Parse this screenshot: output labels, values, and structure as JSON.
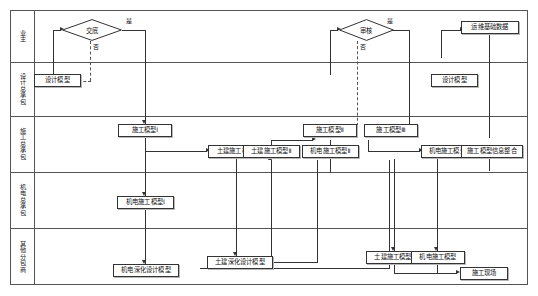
{
  "diagram": {
    "type": "swimlane-flowchart",
    "colors": {
      "line": "#333333",
      "frame": "#555555",
      "node_fill": "#ffffff",
      "text": "#111111"
    },
    "lanes": [
      {
        "id": "owner",
        "label": "业主"
      },
      {
        "id": "design",
        "label": "设计总承包"
      },
      {
        "id": "gc",
        "label": "施工总承包"
      },
      {
        "id": "mep_gc",
        "label": "机电总承包"
      },
      {
        "id": "sub",
        "label": "其他分包商"
      }
    ],
    "nodes": [
      {
        "id": "d1",
        "lane": "owner",
        "shape": "diamond",
        "label": "交底"
      },
      {
        "id": "d2",
        "lane": "owner",
        "shape": "diamond",
        "label": "审核"
      },
      {
        "id": "n1",
        "lane": "owner",
        "shape": "box",
        "label": "运维基础数据"
      },
      {
        "id": "n2",
        "lane": "design",
        "shape": "box",
        "label": "设计模型"
      },
      {
        "id": "n3",
        "lane": "design",
        "shape": "box",
        "label": "设计模型"
      },
      {
        "id": "n4",
        "lane": "gc",
        "shape": "box",
        "label": "施工模型Ⅰ"
      },
      {
        "id": "n5",
        "lane": "gc",
        "shape": "box",
        "label": "土建施工模型Ⅰ"
      },
      {
        "id": "n6",
        "lane": "gc",
        "shape": "box",
        "label": "土建施工模型Ⅱ"
      },
      {
        "id": "n7",
        "lane": "gc",
        "shape": "box",
        "label": "施工模型Ⅱ"
      },
      {
        "id": "n8",
        "lane": "gc",
        "shape": "box",
        "label": "机电施工模型Ⅱ"
      },
      {
        "id": "n9",
        "lane": "gc",
        "shape": "box",
        "label": "施工模型Ⅲ"
      },
      {
        "id": "n10",
        "lane": "gc",
        "shape": "box",
        "label": "机电施工模型Ⅲ"
      },
      {
        "id": "n11",
        "lane": "gc",
        "shape": "box",
        "label": "施工模型信息整合"
      },
      {
        "id": "n12",
        "lane": "mep_gc",
        "shape": "box",
        "label": "机电施工模型Ⅰ"
      },
      {
        "id": "n13",
        "lane": "sub",
        "shape": "box",
        "label": "土建深化设计模型"
      },
      {
        "id": "n14",
        "lane": "sub",
        "shape": "box",
        "label": "机电深化设计模型"
      },
      {
        "id": "n15",
        "lane": "sub",
        "shape": "box",
        "label": "土建施工模型"
      },
      {
        "id": "n16",
        "lane": "sub",
        "shape": "box",
        "label": "机电施工模型"
      },
      {
        "id": "n17",
        "lane": "sub",
        "shape": "box",
        "label": "施工现场"
      }
    ],
    "edge_labels": {
      "d1_yes": "是",
      "d1_no": "否",
      "d2_yes": "是",
      "d2_no": "否"
    }
  }
}
